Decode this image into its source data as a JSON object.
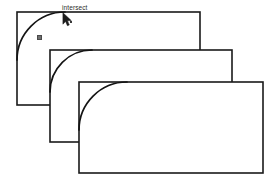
{
  "canvas": {
    "width": 278,
    "height": 188,
    "background_color": "#ffffff",
    "stroke_color": "#1a1a1a",
    "arc_color": "#141414",
    "marker_color": "#6f6f6f",
    "cursor_color": "#1c1c1c",
    "tooltip_color": "#2b2b2b"
  },
  "tooltip": {
    "label": "intersect",
    "x": 62,
    "y": 4
  },
  "cursor": {
    "name": "arrow-pointer",
    "x": 62,
    "y": 12,
    "snap_box_x": 70,
    "snap_box_y": 21
  },
  "snap_marker": {
    "name": "snap-point-marker",
    "x": 37,
    "y": 35
  },
  "shapes": [
    {
      "id": "rect-back",
      "label": "Rectangle 1",
      "x": 17,
      "y": 12,
      "width": 183,
      "height": 93,
      "arc_radius": 48
    },
    {
      "id": "rect-middle",
      "label": "Rectangle 2",
      "x": 50,
      "y": 50,
      "width": 182,
      "height": 92,
      "arc_radius": 42
    },
    {
      "id": "rect-front",
      "label": "Rectangle 3",
      "x": 79,
      "y": 82,
      "width": 184,
      "height": 91,
      "arc_radius": 48
    }
  ]
}
